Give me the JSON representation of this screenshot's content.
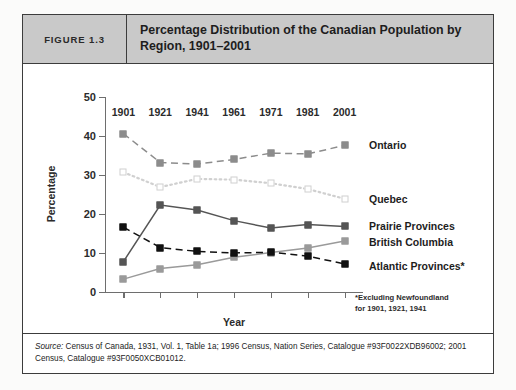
{
  "figure": {
    "number_label": "FIGURE 1.3",
    "title": "Percentage Distribution of the Canadian Population by Region, 1901–2001"
  },
  "footnote": {
    "line1": "*Excluding Newfoundland",
    "line2": "for 1901, 1921, 1941"
  },
  "source": {
    "label": "Source:",
    "text": " Census of Canada, 1931, Vol. 1, Table 1a; 1996 Census, Nation Series, Catalogue #93F0022XDB96002; 2001 Census, Catalogue #93F0050XCB01012."
  },
  "colors": {
    "ontario": "#8c8c8c",
    "quebec": "#d0d0d0",
    "prairie": "#555555",
    "british_columbia": "#9a9a9a",
    "atlantic": "#111111",
    "axis": "#6e6e6e",
    "header_band": "#c9c9c9",
    "frame": "#3c3c3c"
  },
  "chart_data": {
    "type": "line",
    "title": "Percentage Distribution of the Canadian Population by Region, 1901–2001",
    "xlabel": "Year",
    "ylabel": "Percentage",
    "categories": [
      "1901",
      "1921",
      "1941",
      "1961",
      "1971",
      "1981",
      "2001"
    ],
    "x": [
      1901,
      1921,
      1941,
      1961,
      1971,
      1981,
      2001
    ],
    "ylim": [
      0,
      50
    ],
    "yticks": [
      0,
      10,
      20,
      30,
      40,
      50
    ],
    "grid": false,
    "legend_position": "right-inline",
    "series": [
      {
        "name": "Ontario",
        "values": [
          40.6,
          33.2,
          32.8,
          34.0,
          35.6,
          35.4,
          37.6
        ],
        "color": "#8c8c8c",
        "line_style": "dashed",
        "marker": "filled-square"
      },
      {
        "name": "Quebec",
        "values": [
          30.7,
          26.9,
          29.0,
          28.8,
          27.9,
          26.4,
          23.9
        ],
        "color": "#d0d0d0",
        "line_style": "dotted",
        "marker": "open-square"
      },
      {
        "name": "Prairie Provinces",
        "values": [
          7.8,
          22.3,
          21.0,
          18.3,
          16.4,
          17.3,
          16.8
        ],
        "color": "#555555",
        "line_style": "solid",
        "marker": "filled-square"
      },
      {
        "name": "British Columbia",
        "values": [
          3.3,
          6.0,
          7.0,
          8.9,
          10.1,
          11.3,
          13.1
        ],
        "color": "#9a9a9a",
        "line_style": "solid",
        "marker": "filled-square"
      },
      {
        "name": "Atlantic Provinces*",
        "values": [
          16.6,
          11.4,
          10.4,
          10.0,
          10.2,
          9.2,
          7.2
        ],
        "color": "#111111",
        "line_style": "dashed",
        "marker": "filled-square"
      }
    ],
    "annotations": [
      "*Excluding Newfoundland for 1901, 1921, 1941"
    ]
  }
}
